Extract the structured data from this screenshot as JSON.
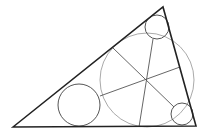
{
  "diagram": {
    "colors": {
      "triangle": "#222222",
      "circle": "#555555",
      "incircle": "#aaaaaa",
      "line": "#555555"
    },
    "triangle": {
      "points": "13,127 163,7 196,126"
    },
    "incircle": {
      "cx": 147,
      "cy": 80,
      "r": 47
    },
    "circles": [
      {
        "cx": 157,
        "cy": 27,
        "r": 12
      },
      {
        "cx": 79,
        "cy": 105,
        "r": 21
      },
      {
        "cx": 182,
        "cy": 114,
        "r": 11
      }
    ],
    "lines": [
      {
        "x1": 113,
        "y1": 48,
        "x2": 174,
        "y2": 107
      },
      {
        "x1": 180,
        "y1": 67,
        "x2": 100,
        "y2": 96
      },
      {
        "x1": 153,
        "y1": 39,
        "x2": 139,
        "y2": 127
      }
    ]
  }
}
